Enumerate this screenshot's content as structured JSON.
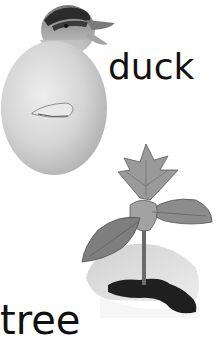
{
  "panels": [
    {
      "label": "duck",
      "image": "duckling-hatching-from-egg",
      "description": "Duckling head emerging from the top of a white egg"
    },
    {
      "label": "tree",
      "image": "sapling-growing-from-eggshell",
      "description": "Young tree seedling with leaves growing from soil in a broken eggshell"
    }
  ],
  "colors": {
    "background": "#ffffff",
    "text": "#111111",
    "egg": "#d8d8d8",
    "egg_shadow": "#b8b8b8",
    "leaf": "#8a8a8a",
    "leaf_dark": "#5a5a5a",
    "soil": "#1e1e1e",
    "duck_head": "#9a9a9a",
    "duck_stripe": "#2a2a2a"
  }
}
